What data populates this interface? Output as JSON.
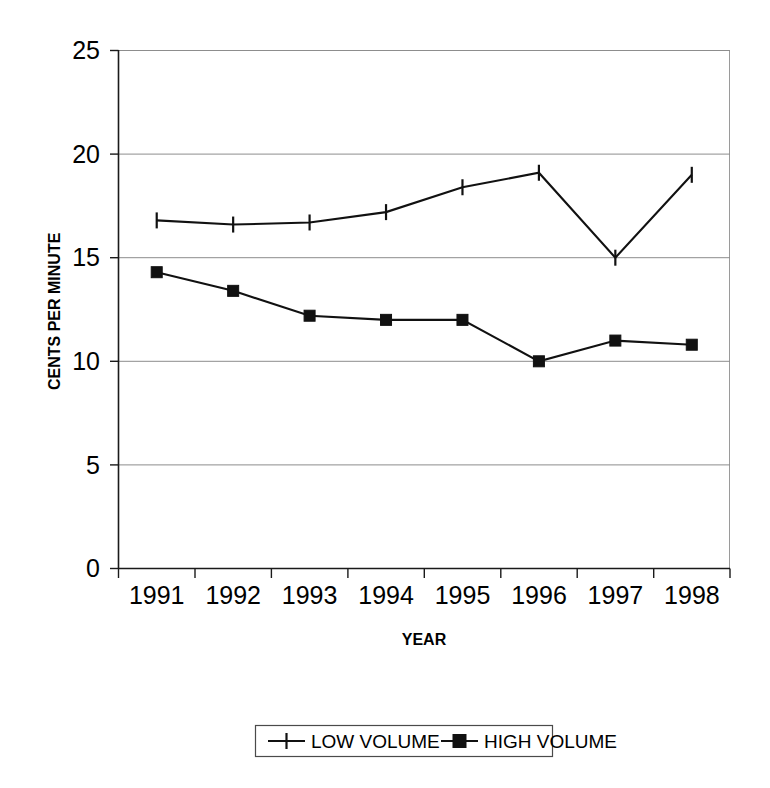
{
  "chart_data": {
    "type": "line",
    "title": "",
    "xlabel": "YEAR",
    "ylabel": "CENTS PER MINUTE",
    "categories": [
      "1991",
      "1992",
      "1993",
      "1994",
      "1995",
      "1996",
      "1997",
      "1998"
    ],
    "series": [
      {
        "name": "LOW VOLUME",
        "marker": "plus",
        "values": [
          16.8,
          16.6,
          16.7,
          17.2,
          18.4,
          19.1,
          15.0,
          19.0
        ]
      },
      {
        "name": "HIGH VOLUME",
        "marker": "square",
        "values": [
          14.3,
          13.4,
          12.2,
          12.0,
          12.0,
          10.0,
          11.0,
          10.8
        ]
      }
    ],
    "ylim": [
      0,
      25
    ],
    "yticks": [
      "0",
      "5",
      "10",
      "15",
      "20",
      "25"
    ],
    "ytick_values": [
      0,
      5,
      10,
      15,
      20,
      25
    ],
    "grid": true,
    "grid_axis": "y",
    "legend_position": "bottom",
    "line_color": "#111111",
    "grid_color": "#8d8d8d",
    "background_color": "#ffffff"
  },
  "legend": {
    "entries": [
      {
        "label": "LOW VOLUME",
        "marker": "plus"
      },
      {
        "label": "HIGH VOLUME",
        "marker": "square"
      }
    ]
  }
}
